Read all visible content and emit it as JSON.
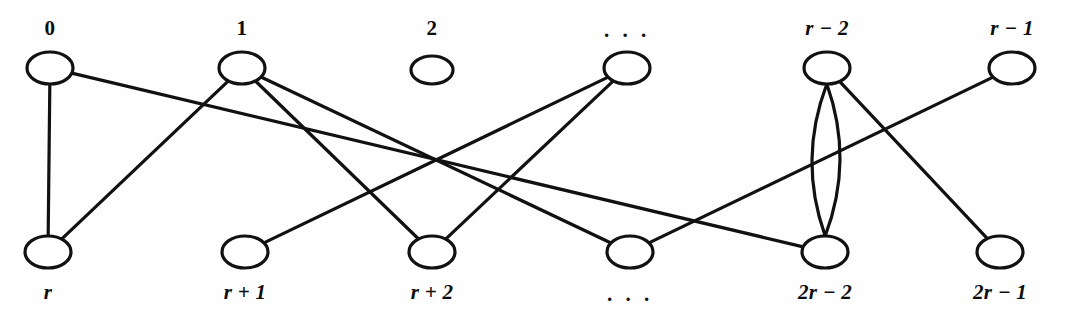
{
  "figure": {
    "kind": "bipartite-multigraph-diagram",
    "background_color": "#fefefe",
    "stroke_color": "#111111",
    "node_fill": "#ffffff",
    "width": 1075,
    "height": 316
  },
  "chart_data": {
    "type": "diagram",
    "title": "",
    "top_row": [
      {
        "id": "v0",
        "label": "0",
        "x": 50,
        "y": 68,
        "rx": 23,
        "ry": 16,
        "label_x": 50,
        "label_y": 28,
        "italic": false
      },
      {
        "id": "v1",
        "label": "1",
        "x": 242,
        "y": 68,
        "rx": 23,
        "ry": 16,
        "label_x": 242,
        "label_y": 28,
        "italic": false
      },
      {
        "id": "v2",
        "label": "2",
        "x": 432,
        "y": 70,
        "rx": 21,
        "ry": 14,
        "label_x": 432,
        "label_y": 28,
        "italic": false
      },
      {
        "id": "vdots",
        "label": ". . .",
        "x": 627,
        "y": 68,
        "rx": 23,
        "ry": 16,
        "label_x": 627,
        "label_y": 30,
        "italic": false
      },
      {
        "id": "vr2",
        "label": "r − 2",
        "x": 827,
        "y": 68,
        "rx": 23,
        "ry": 16,
        "label_x": 827,
        "label_y": 28,
        "italic": true
      },
      {
        "id": "vr1",
        "label": "r − 1",
        "x": 1012,
        "y": 68,
        "rx": 23,
        "ry": 16,
        "label_x": 1012,
        "label_y": 28,
        "italic": true
      }
    ],
    "bottom_row": [
      {
        "id": "u0",
        "label": "r",
        "x": 48,
        "y": 252,
        "rx": 23,
        "ry": 16,
        "label_x": 48,
        "label_y": 292,
        "italic": true
      },
      {
        "id": "u1",
        "label": "r + 1",
        "x": 245,
        "y": 252,
        "rx": 23,
        "ry": 16,
        "label_x": 245,
        "label_y": 292,
        "italic": true
      },
      {
        "id": "u2",
        "label": "r + 2",
        "x": 432,
        "y": 252,
        "rx": 23,
        "ry": 16,
        "label_x": 432,
        "label_y": 292,
        "italic": true
      },
      {
        "id": "udots",
        "label": ". . .",
        "x": 630,
        "y": 252,
        "rx": 23,
        "ry": 16,
        "label_x": 630,
        "label_y": 294,
        "italic": false
      },
      {
        "id": "u2r2",
        "label": "2r − 2",
        "x": 825,
        "y": 252,
        "rx": 23,
        "ry": 16,
        "label_x": 825,
        "label_y": 292,
        "italic": true
      },
      {
        "id": "u2r1",
        "label": "2r − 1",
        "x": 1000,
        "y": 252,
        "rx": 23,
        "ry": 16,
        "label_x": 1000,
        "label_y": 292,
        "italic": true
      }
    ],
    "edges": [
      {
        "from": "v0",
        "to": "u0",
        "kind": "straight"
      },
      {
        "from": "v0",
        "to": "u2r2",
        "kind": "straight"
      },
      {
        "from": "v1",
        "to": "u0",
        "kind": "straight"
      },
      {
        "from": "v1",
        "to": "u2",
        "kind": "straight"
      },
      {
        "from": "v1",
        "to": "udots",
        "kind": "straight"
      },
      {
        "from": "vdots",
        "to": "u1",
        "kind": "straight"
      },
      {
        "from": "vdots",
        "to": "u2",
        "kind": "straight"
      },
      {
        "from": "vr2",
        "to": "u2r2",
        "kind": "parallel-arc",
        "bow": 14
      },
      {
        "from": "vr2",
        "to": "u2r2",
        "kind": "parallel-arc",
        "bow": -14
      },
      {
        "from": "vr2",
        "to": "u2r1",
        "kind": "straight"
      },
      {
        "from": "vr1",
        "to": "udots",
        "kind": "straight"
      }
    ],
    "isolated_nodes": [
      "v2"
    ]
  }
}
